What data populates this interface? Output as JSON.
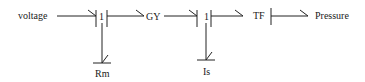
{
  "diagram": {
    "type": "bond-graph",
    "nodes": {
      "voltage": {
        "label": "voltage",
        "kind": "source"
      },
      "junction1": {
        "label": "1",
        "kind": "1-junction"
      },
      "gy": {
        "label": "GY",
        "kind": "gyrator"
      },
      "junction2": {
        "label": "1",
        "kind": "1-junction"
      },
      "tf": {
        "label": "TF",
        "kind": "transformer"
      },
      "pressure": {
        "label": "Pressure",
        "kind": "output"
      },
      "rm": {
        "label": "Rm",
        "kind": "resistor"
      },
      "is": {
        "label": "Is",
        "kind": "inertia"
      }
    },
    "bonds": [
      {
        "from": "voltage",
        "to": "junction1",
        "causal_stroke": "junction1"
      },
      {
        "from": "junction1",
        "to": "gy",
        "causal_stroke": "junction1"
      },
      {
        "from": "gy",
        "to": "junction2",
        "causal_stroke": "junction2"
      },
      {
        "from": "junction2",
        "to": "tf",
        "causal_stroke": "junction2"
      },
      {
        "from": "tf",
        "to": "pressure",
        "causal_stroke": "tf"
      },
      {
        "from": "junction1",
        "to": "rm",
        "causal_stroke": "rm"
      },
      {
        "from": "junction2",
        "to": "is",
        "causal_stroke": "is"
      }
    ],
    "colors": {
      "stroke": "#222222",
      "text": "#1a1a1a",
      "background": "#ffffff"
    }
  }
}
